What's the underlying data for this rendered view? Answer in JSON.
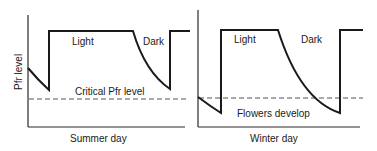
{
  "figure": {
    "y_axis_label": "Pfr level",
    "left_panel": {
      "x_label": "Summer day",
      "light_label": "Light",
      "dark_label": "Dark",
      "threshold_label": "Critical Pfr level"
    },
    "right_panel": {
      "x_label": "Winter day",
      "light_label": "Light",
      "dark_label": "Dark",
      "threshold_label": "Flowers develop"
    },
    "colors": {
      "line": "#1a1a1a",
      "axis": "#2a2a2a",
      "dashed": "#555555"
    }
  }
}
